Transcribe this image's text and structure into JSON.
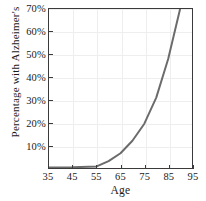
{
  "chart_data": {
    "type": "line",
    "title": "",
    "xlabel": "Age",
    "ylabel": "Percentage with Alzheimer's",
    "xlim": [
      35,
      95
    ],
    "ylim": [
      0,
      70
    ],
    "grid": true,
    "legend": null,
    "xticks": [
      35,
      45,
      55,
      65,
      75,
      85,
      95
    ],
    "xticklabels": [
      "35",
      "45",
      "55",
      "65",
      "75",
      "85",
      "95"
    ],
    "yticks": [
      10,
      20,
      30,
      40,
      50,
      60,
      70
    ],
    "yticklabels": [
      "10%",
      "20%",
      "30%",
      "40%",
      "50%",
      "60%",
      "70%"
    ],
    "series": [
      {
        "name": "Percentage with Alzheimer's",
        "color": "#6b6b6b",
        "linewidth": 2,
        "x": [
          35,
          45,
          55,
          60,
          65,
          70,
          75,
          80,
          85,
          90
        ],
        "values": [
          0.2,
          0.3,
          0.7,
          3.0,
          6.5,
          12.0,
          19.5,
          31.0,
          48.0,
          70.0
        ]
      }
    ]
  },
  "axis_color": "#3a3a3a",
  "grid_color": "#eeeeee",
  "background_color": "#ffffff"
}
